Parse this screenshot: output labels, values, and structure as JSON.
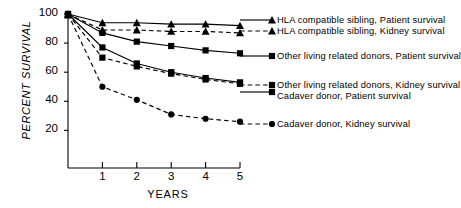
{
  "chart_data": {
    "type": "line",
    "title": "",
    "xlabel": "YEARS",
    "ylabel": "PERCENT SURVIVAL",
    "x": [
      0,
      1,
      2,
      3,
      4,
      5
    ],
    "xlim": [
      0,
      5
    ],
    "ylim": [
      0,
      100
    ],
    "xticks": [
      "1",
      "2",
      "3",
      "4",
      "5"
    ],
    "yticks": [
      "20",
      "40",
      "60",
      "80",
      "100"
    ],
    "grid": false,
    "legend_position": "right",
    "series": [
      {
        "name": "HLA compatible sibling, Patient survival",
        "marker": "triangle",
        "line": "solid",
        "color": "#000000",
        "values": [
          100,
          94,
          94,
          93,
          93,
          92
        ]
      },
      {
        "name": "HLA compatible sibling, Kidney survival",
        "marker": "triangle",
        "line": "dashed",
        "color": "#000000",
        "values": [
          100,
          89,
          89,
          88,
          88,
          87
        ]
      },
      {
        "name": "Other living related donors, Patient survival",
        "marker": "square",
        "line": "solid",
        "color": "#000000",
        "values": [
          100,
          87,
          81,
          78,
          75,
          73
        ]
      },
      {
        "name": "Other living related donors, Kidney survival",
        "marker": "square",
        "line": "dashed",
        "color": "#000000",
        "values": [
          100,
          70,
          64,
          59,
          55,
          52
        ]
      },
      {
        "name": "Cadaver donor, Patient survival",
        "marker": "square",
        "line": "solid",
        "color": "#000000",
        "values": [
          100,
          77,
          66,
          60,
          56,
          53
        ]
      },
      {
        "name": "Cadaver donor, Kidney survival",
        "marker": "circle",
        "line": "dashed",
        "color": "#000000",
        "values": [
          100,
          50,
          41,
          31,
          28,
          26
        ]
      }
    ]
  },
  "axes": {
    "ylabel": "PERCENT SURVIVAL",
    "xlabel": "YEARS",
    "yticks": [
      {
        "label": "100",
        "value": 100
      },
      {
        "label": "80",
        "value": 80
      },
      {
        "label": "60",
        "value": 60
      },
      {
        "label": "40",
        "value": 40
      },
      {
        "label": "20",
        "value": 20
      }
    ],
    "xticks": [
      {
        "label": "1",
        "value": 1
      },
      {
        "label": "2",
        "value": 2
      },
      {
        "label": "3",
        "value": 3
      },
      {
        "label": "4",
        "value": 4
      },
      {
        "label": "5",
        "value": 5
      }
    ]
  },
  "legend": {
    "entries": [
      {
        "label": "HLA compatible sibling, Patient survival",
        "marker": "triangle",
        "line": "solid"
      },
      {
        "label": "HLA compatible sibling, Kidney survival",
        "marker": "triangle",
        "line": "dashed"
      },
      {
        "label": "Other living related donors, Patient survival",
        "marker": "square",
        "line": "solid"
      },
      {
        "label": "Other living related donors, Kidney survival",
        "marker": "square",
        "line": "dashed"
      },
      {
        "label": "Cadaver donor, Patient survival",
        "marker": "square",
        "line": "solid"
      },
      {
        "label": "Cadaver donor, Kidney survival",
        "marker": "circle",
        "line": "dashed"
      }
    ]
  }
}
